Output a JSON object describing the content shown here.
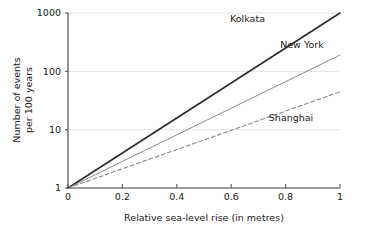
{
  "chart_data": {
    "type": "line",
    "title": "",
    "xlabel": "Relative sea-level rise (in metres)",
    "ylabel_line1": "Number of events",
    "ylabel_line2": "per 100 years",
    "ylabel": "Number of events per 100 years",
    "xlim": [
      0,
      1
    ],
    "ylim": [
      1,
      1000
    ],
    "yscale": "log",
    "xscale": "linear",
    "grid": true,
    "grid_axis": "y",
    "legend_position": "inline-labels",
    "xticks": [
      0,
      0.2,
      0.4,
      0.6,
      0.8,
      1
    ],
    "xtick_labels": [
      "0",
      "0.2",
      "0.4",
      "0.6",
      "0.8",
      "1"
    ],
    "yticks": [
      1,
      10,
      100,
      1000
    ],
    "ytick_labels": [
      "1",
      "10",
      "100",
      "1000"
    ],
    "x": [
      0,
      0.2,
      0.4,
      0.6,
      0.8,
      1
    ],
    "series": [
      {
        "name": "Kolkata",
        "values": [
          1,
          3.98,
          15.85,
          63.1,
          251.2,
          1000
        ],
        "endpoint_value": 1000,
        "color": "#2b2b2b",
        "style": "solid",
        "width": 1.6,
        "label_x": 0.66,
        "label_y_px": 22
      },
      {
        "name": "New York",
        "values": [
          1,
          2.86,
          8.16,
          23.3,
          66.6,
          190
        ],
        "endpoint_value": 190,
        "color": "#8a8a8a",
        "style": "solid",
        "width": 1.0,
        "label_x": 0.86,
        "label_y_px": 48
      },
      {
        "name": "Shanghai",
        "values": [
          1,
          2.14,
          4.56,
          9.74,
          20.8,
          44.5
        ],
        "endpoint_value": 44.5,
        "color": "#8a8a8a",
        "style": "dashed",
        "width": 1.1,
        "label_x": 0.82,
        "label_y_px": 121
      }
    ]
  },
  "axes": {
    "axis_color": "#4a4a4a",
    "grid_color": "#e4e4e4",
    "background": "#ffffff"
  }
}
